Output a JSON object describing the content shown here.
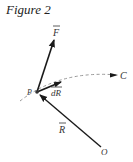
{
  "figure": {
    "title": "Figure 2",
    "labels": {
      "force": "F",
      "point": "P",
      "displacement": "dR",
      "curve": "C",
      "position": "R",
      "origin": "O"
    },
    "vectors": [
      {
        "name": "F",
        "from": "P",
        "description": "force vector pointing up-right from P"
      },
      {
        "name": "dR",
        "from": "P",
        "description": "displacement vector tangent to curve C"
      },
      {
        "name": "R",
        "from": "O",
        "to": "P",
        "description": "position vector from origin O to P"
      }
    ],
    "curve": {
      "name": "C",
      "style": "dashed",
      "direction": "toward C"
    },
    "colors": {
      "line": "#1a1a1a",
      "dashed": "#999999",
      "text": "#333333"
    }
  }
}
